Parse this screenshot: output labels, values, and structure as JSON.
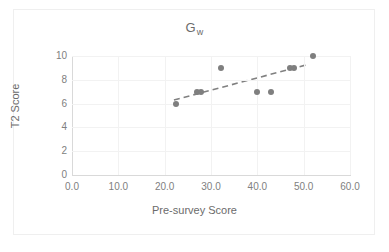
{
  "chart_data": {
    "type": "scatter",
    "title": "Gw",
    "title_base": "G",
    "title_subscript": "w",
    "xlabel": "Pre-survey Score",
    "ylabel": "T2 Score",
    "xlim": [
      0.0,
      60.0
    ],
    "ylim": [
      0,
      10
    ],
    "xticks": [
      "0.0",
      "10.0",
      "20.0",
      "30.0",
      "40.0",
      "50.0",
      "60.0"
    ],
    "xtick_values": [
      0,
      10,
      20,
      30,
      40,
      50,
      60
    ],
    "yticks": [
      "0",
      "2",
      "4",
      "6",
      "8",
      "10"
    ],
    "ytick_values": [
      0,
      2,
      4,
      6,
      8,
      10
    ],
    "grid": true,
    "legend": null,
    "marker_color": "#7f7f7f",
    "trendline_color": "#808080",
    "trendline_style": "dashed",
    "points": [
      {
        "x": 22.5,
        "y": 6
      },
      {
        "x": 27.0,
        "y": 7
      },
      {
        "x": 27.8,
        "y": 7
      },
      {
        "x": 32.2,
        "y": 9
      },
      {
        "x": 40.0,
        "y": 7
      },
      {
        "x": 43.0,
        "y": 7
      },
      {
        "x": 47.0,
        "y": 9
      },
      {
        "x": 48.0,
        "y": 9
      },
      {
        "x": 52.0,
        "y": 10
      }
    ],
    "trendline": {
      "x0": 22.0,
      "y0": 6.3,
      "x1": 51.0,
      "y1": 9.3
    }
  }
}
